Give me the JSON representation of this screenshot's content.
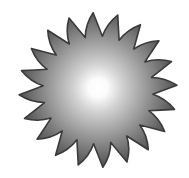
{
  "image": {
    "subject": "sun-starburst",
    "ray_count": 20,
    "center": [
      98,
      90
    ],
    "outer_radius": 79,
    "inner_radius": 55,
    "colors": {
      "background": "#ffffff",
      "center": "#ffffff",
      "mid": "#b0b0b0",
      "edge": "#5a5a5a",
      "outline": "#3a3a3a"
    }
  }
}
